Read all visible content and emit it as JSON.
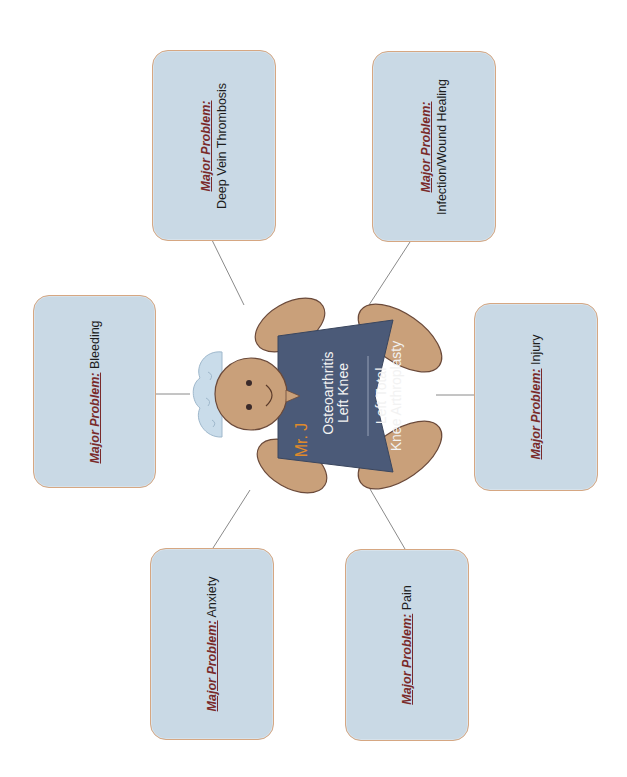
{
  "diagram": {
    "type": "concept-map",
    "orientation": "rotated-90-ccw",
    "colors": {
      "box_fill": "#c9d9e5",
      "box_border": "#d6a782",
      "label_color": "#7a2a2a",
      "connector": "#8a8a8a",
      "skin": "#c9a07a",
      "shirt": "#4b5a78",
      "cap": "#c9dcea",
      "name_color": "#e08a2a"
    },
    "center": {
      "name": "Mr. J",
      "diagnosis_line1": "Osteoarthritis",
      "diagnosis_line2": "Left Knee",
      "procedure_line1": "Left Total",
      "procedure_line2": "Knee Arthroplasty"
    },
    "problems": [
      {
        "label": "Major Problem:",
        "value": "Deep Vein Thrombosis"
      },
      {
        "label": "Major Problem:",
        "value": "Infection/Wound Healing"
      },
      {
        "label": "Major Problem:",
        "value": "Bleeding"
      },
      {
        "label": "Major Problem:",
        "value": "Injury"
      },
      {
        "label": "Major Problem:",
        "value": "Anxiety"
      },
      {
        "label": "Major Problem:",
        "value": "Pain"
      }
    ]
  }
}
